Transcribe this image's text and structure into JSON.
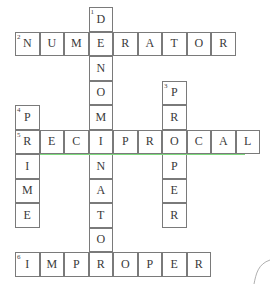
{
  "puzzle": {
    "cell_size": 24.5,
    "origin_x": 15,
    "origin_y": 7,
    "entries": [
      {
        "number": "1",
        "word": "DENOMINATOR",
        "direction": "down",
        "row": 0,
        "col": 3
      },
      {
        "number": "2",
        "word": "NUMERATOR",
        "direction": "across",
        "row": 1,
        "col": 0
      },
      {
        "number": "3",
        "word": "PROPER",
        "direction": "down",
        "row": 3,
        "col": 6
      },
      {
        "number": "4",
        "word": "PRIME",
        "direction": "down",
        "row": 4,
        "col": 0
      },
      {
        "number": "5",
        "word": "RECIPROCAL",
        "direction": "across",
        "row": 5,
        "col": 0
      },
      {
        "number": "6",
        "word": "IMPROPER",
        "direction": "across",
        "row": 10,
        "col": 0
      }
    ]
  },
  "colors": {
    "border": "#7a7a7a",
    "letter": "#3a3a3a",
    "highlight_line": "#7ed97e"
  }
}
